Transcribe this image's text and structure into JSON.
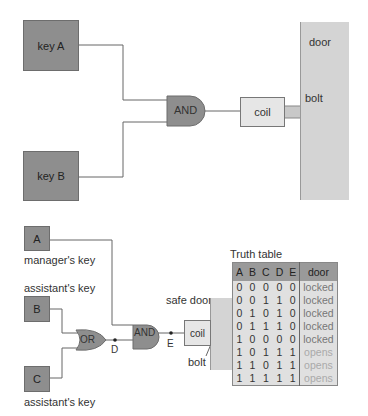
{
  "top_circuit": {
    "key_a": "key A",
    "key_b": "key B",
    "gate": "AND",
    "coil": "coil",
    "bolt": "bolt",
    "door": "door"
  },
  "bottom_circuit": {
    "key_a": "A",
    "key_a_label": "manager's key",
    "key_b": "B",
    "key_b_label": "assistant's key",
    "key_c": "C",
    "key_c_label": "assistant's key",
    "or_gate": "OR",
    "and_gate": "AND",
    "node_d": "D",
    "node_e": "E",
    "coil": "coil",
    "bolt": "bolt",
    "safe_door": "safe door"
  },
  "truth_table": {
    "title": "Truth table",
    "headers": [
      "A",
      "B",
      "C",
      "D",
      "E",
      "door"
    ],
    "rows": [
      [
        "0",
        "0",
        "0",
        "0",
        "0",
        "locked"
      ],
      [
        "0",
        "0",
        "1",
        "1",
        "0",
        "locked"
      ],
      [
        "0",
        "1",
        "0",
        "1",
        "0",
        "locked"
      ],
      [
        "0",
        "1",
        "1",
        "1",
        "0",
        "locked"
      ],
      [
        "1",
        "0",
        "0",
        "0",
        "0",
        "locked"
      ],
      [
        "1",
        "0",
        "1",
        "1",
        "1",
        "opens"
      ],
      [
        "1",
        "1",
        "0",
        "1",
        "1",
        "opens"
      ],
      [
        "1",
        "1",
        "1",
        "1",
        "1",
        "opens"
      ]
    ]
  }
}
